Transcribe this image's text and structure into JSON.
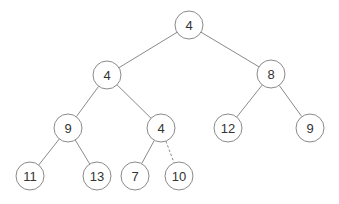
{
  "diagram": {
    "type": "binary-tree",
    "colors": {
      "stroke": "#8a8a8a",
      "text": "#333333",
      "background": "#ffffff"
    },
    "node_radius": 14,
    "nodes": [
      {
        "id": "n0",
        "label": "4",
        "x": 189,
        "y": 25
      },
      {
        "id": "n1",
        "label": "4",
        "x": 107,
        "y": 75
      },
      {
        "id": "n2",
        "label": "8",
        "x": 271,
        "y": 74
      },
      {
        "id": "n3",
        "label": "9",
        "x": 68,
        "y": 128
      },
      {
        "id": "n4",
        "label": "4",
        "x": 161,
        "y": 128
      },
      {
        "id": "n5",
        "label": "12",
        "x": 228,
        "y": 128
      },
      {
        "id": "n6",
        "label": "9",
        "x": 310,
        "y": 128
      },
      {
        "id": "n7",
        "label": "11",
        "x": 30,
        "y": 176
      },
      {
        "id": "n8",
        "label": "13",
        "x": 97,
        "y": 176
      },
      {
        "id": "n9",
        "label": "7",
        "x": 135,
        "y": 176
      },
      {
        "id": "n10",
        "label": "10",
        "x": 179,
        "y": 176
      }
    ],
    "edges": [
      {
        "from": "n0",
        "to": "n1",
        "style": "solid"
      },
      {
        "from": "n0",
        "to": "n2",
        "style": "solid"
      },
      {
        "from": "n1",
        "to": "n3",
        "style": "solid"
      },
      {
        "from": "n1",
        "to": "n4",
        "style": "solid"
      },
      {
        "from": "n2",
        "to": "n5",
        "style": "solid"
      },
      {
        "from": "n2",
        "to": "n6",
        "style": "solid"
      },
      {
        "from": "n3",
        "to": "n7",
        "style": "solid"
      },
      {
        "from": "n3",
        "to": "n8",
        "style": "solid"
      },
      {
        "from": "n4",
        "to": "n9",
        "style": "solid"
      },
      {
        "from": "n4",
        "to": "n10",
        "style": "dashed"
      }
    ]
  }
}
